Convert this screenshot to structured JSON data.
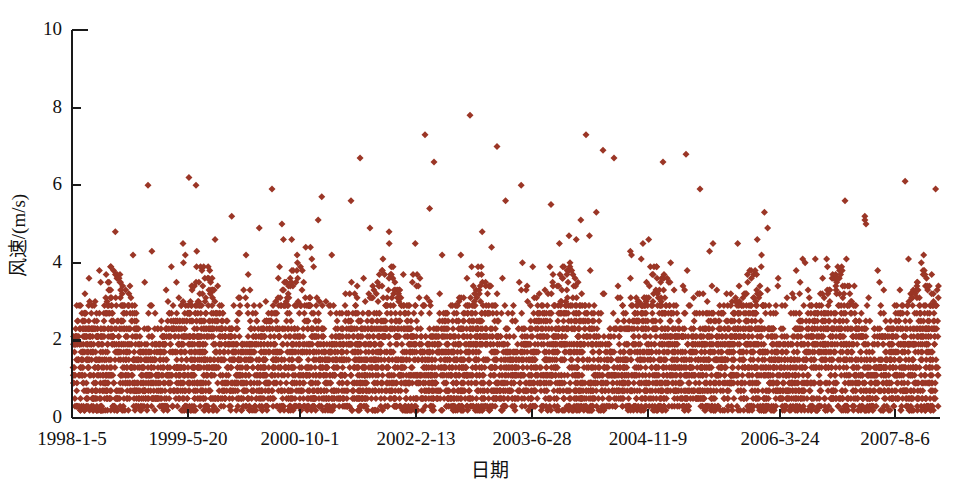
{
  "chart_data": {
    "type": "scatter",
    "title": "",
    "subtitle": "",
    "xlabel": "日期",
    "ylabel": "风速/(m/s)",
    "ylim": [
      0,
      10
    ],
    "yticks": [
      0,
      2,
      4,
      6,
      8,
      10
    ],
    "ytick_labels": [
      "0",
      "2",
      "4",
      "6",
      "8",
      "10"
    ],
    "xtick_labels": [
      "1998-1-5",
      "1999-5-20",
      "2000-10-1",
      "2002-2-13",
      "2003-6-28",
      "2004-11-9",
      "2006-3-24",
      "2007-8-6"
    ],
    "xtick_positions_px": [
      72,
      188,
      300,
      416,
      532,
      648,
      780,
      895
    ],
    "grid": false,
    "legend": false,
    "legend_position": "none",
    "marker": "diamond",
    "marker_size_px": 7,
    "series_name": "风速",
    "colors": {
      "marker": "#9B3626",
      "axis": "#1a1a1a",
      "background": "#ffffff",
      "text": "#111111"
    },
    "observed_max": 7.8,
    "observed_min": 0.1,
    "n_points_approx": 3500,
    "x_range_label": [
      "1998-1-5",
      "2007-8-6"
    ],
    "value_bands": [
      0.2,
      0.3,
      0.5,
      0.7,
      0.9,
      1.1,
      1.3,
      1.5,
      1.7,
      1.9,
      2.1,
      2.3,
      2.5,
      2.7,
      2.9
    ],
    "notable_peaks": [
      {
        "x_px": 148,
        "value": 6.0
      },
      {
        "x_px": 196,
        "value": 6.0
      },
      {
        "x_px": 272,
        "value": 5.9
      },
      {
        "x_px": 351,
        "value": 5.6
      },
      {
        "x_px": 425,
        "value": 7.3
      },
      {
        "x_px": 434,
        "value": 6.6
      },
      {
        "x_px": 470,
        "value": 7.8
      },
      {
        "x_px": 497,
        "value": 7.0
      },
      {
        "x_px": 551,
        "value": 5.5
      },
      {
        "x_px": 586,
        "value": 7.3
      },
      {
        "x_px": 603,
        "value": 6.9
      },
      {
        "x_px": 614,
        "value": 6.7
      },
      {
        "x_px": 686,
        "value": 6.8
      },
      {
        "x_px": 700,
        "value": 5.9
      },
      {
        "x_px": 845,
        "value": 5.6
      },
      {
        "x_px": 866,
        "value": 5.0
      }
    ]
  },
  "axes": {
    "plot_left_px": 72,
    "plot_right_px": 940,
    "plot_top_px": 30,
    "plot_bottom_px": 418,
    "left_spine": true,
    "bottom_spine": true,
    "top_spine_stub": true,
    "right_spine": false
  }
}
